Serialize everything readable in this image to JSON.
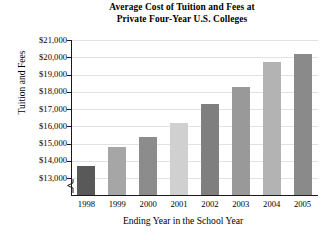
{
  "chart_data": {
    "type": "bar",
    "title": "Average Cost of Tuition and Fees at Private Four-Year U.S. Colleges",
    "title_line1": "Average Cost of Tuition and Fees at",
    "title_line2": "Private Four-Year U.S. Colleges",
    "xlabel": "Ending Year in the School Year",
    "ylabel": "Tuition and Fees",
    "categories": [
      "1998",
      "1999",
      "2000",
      "2001",
      "2002",
      "2003",
      "2004",
      "2005"
    ],
    "values": [
      13700,
      14800,
      15400,
      16200,
      17300,
      18300,
      19700,
      20200
    ],
    "ylim": [
      13000,
      21000
    ],
    "y_axis_break": true,
    "ytick_labels": [
      "$21,000",
      "$20,000",
      "$19,000",
      "$18,000",
      "$17,000",
      "$16,000",
      "$15,000",
      "$14,000",
      "$13,000"
    ],
    "ytick_values": [
      21000,
      20000,
      19000,
      18000,
      17000,
      16000,
      15000,
      14000,
      13000
    ],
    "grid": true,
    "legend": "none",
    "bar_colors": [
      "#595959",
      "#a6a6a6",
      "#8c8c8c",
      "#d0d0d0",
      "#7f7f7f",
      "#999999",
      "#b3b3b3",
      "#8a8a8a"
    ]
  }
}
